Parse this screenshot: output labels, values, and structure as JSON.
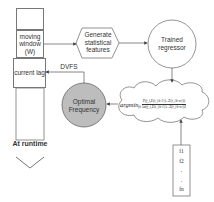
{
  "diagram": {
    "window_column": {
      "moving_window_label": "moving window (W)",
      "current_lag_label": "current lag"
    },
    "at_runtime_label": "At runtime",
    "feature_step_label": "Generate statistical features",
    "regressor_label": "Trained regressor",
    "optimal_frequency_label": "Optimal Frequency",
    "dvfs_label": "DVFS",
    "objective": {
      "operator": "argmin",
      "subscript": "fi",
      "numerator": "P(f_i,Σ(t_{k-1})...Σ(t_{k-w}))",
      "denominator": "lat(f_i,Σ(t_{k-1})...Σ(t_{k-w}))"
    },
    "frequency_list": [
      "f1",
      "f2",
      ".",
      ".",
      "fn"
    ],
    "colors": {
      "stroke": "#777777",
      "optimal_fill": "#bdbdbd",
      "text": "#333333"
    }
  }
}
